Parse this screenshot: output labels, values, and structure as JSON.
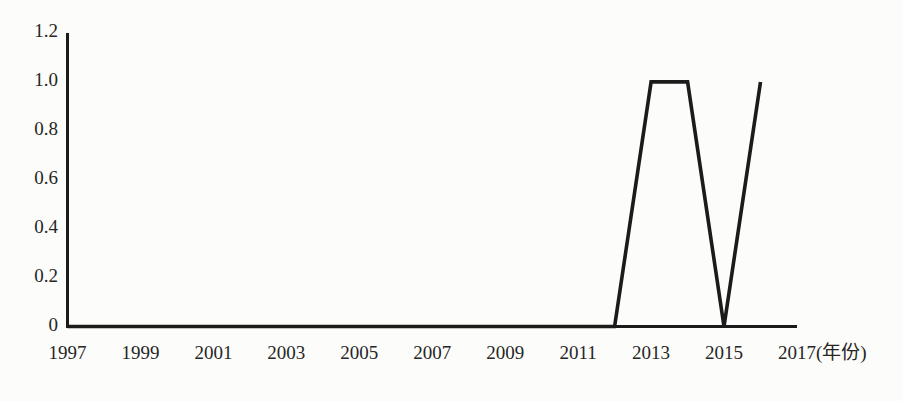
{
  "page": {
    "background": "#fcfcfa"
  },
  "chart_data": {
    "type": "line",
    "title": "",
    "x": [
      1997,
      1998,
      1999,
      2000,
      2001,
      2002,
      2003,
      2004,
      2005,
      2006,
      2007,
      2008,
      2009,
      2010,
      2011,
      2012,
      2013,
      2014,
      2015,
      2016
    ],
    "series": [
      {
        "name": "value-by-year",
        "values": [
          0,
          0,
          0,
          0,
          0,
          0,
          0,
          0,
          0,
          0,
          0,
          0,
          0,
          0,
          0,
          0,
          1.0,
          1.0,
          0,
          1.0
        ]
      }
    ],
    "xticks": [
      "1997",
      "1999",
      "2001",
      "2003",
      "2005",
      "2007",
      "2009",
      "2011",
      "2013",
      "2015",
      "2017"
    ],
    "yticks": [
      "0",
      "0.2",
      "0.4",
      "0.6",
      "0.8",
      "1.0",
      "1.2"
    ],
    "xlabel": "年份",
    "x_axis_suffix": "(年份)",
    "ylabel": "",
    "xlim": [
      1997,
      2017
    ],
    "ylim": [
      0,
      1.2
    ],
    "grid": false,
    "legend": "none",
    "line_color": "#1b1b1b",
    "axis_color": "#1b1b1b",
    "text_color": "#262626"
  }
}
